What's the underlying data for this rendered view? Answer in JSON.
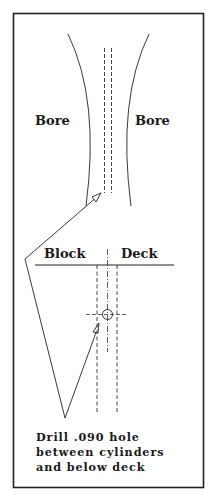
{
  "diagram": {
    "type": "technical-drawing",
    "labels": {
      "bore_left": "Bore",
      "bore_right": "Bore",
      "block": "Block",
      "deck": "Deck"
    },
    "note": {
      "line1": "Drill .090 hole",
      "line2": "between cylinders",
      "line3": "and below deck"
    },
    "colors": {
      "ink": "#1a1a1a",
      "background": "#ffffff"
    }
  }
}
